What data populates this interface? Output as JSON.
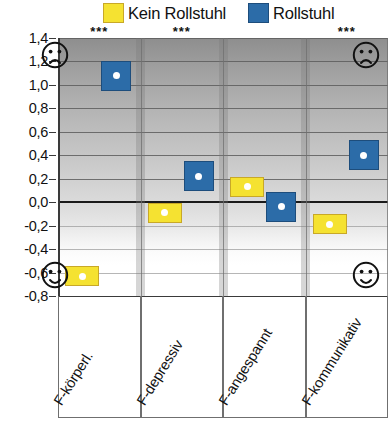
{
  "legend": {
    "entries": [
      {
        "label": "Kein Rollstuhl",
        "color": "#f5e231",
        "key": "kein_rollstuhl"
      },
      {
        "label": "Rollstuhl",
        "color": "#2c6ca8",
        "key": "rollstuhl"
      }
    ]
  },
  "faces": {
    "top_left": "sad-face-icon",
    "top_right": "sad-face-icon",
    "bottom_left": "happy-face-icon",
    "bottom_right": "happy-face-icon"
  },
  "colors": {
    "yellow": "#f5e231",
    "yellow_border": "#c8a828",
    "blue": "#2c6ca8",
    "blue_border": "#1d4d7c",
    "marker_dot": "#ffffff",
    "zero_line": "#1a1a1a",
    "gridline": "#5d5d5d",
    "panel_separator": "#787878"
  },
  "chart_data": {
    "type": "bar",
    "title": "",
    "xlabel": "",
    "ylabel": "",
    "ylim": [
      -0.8,
      1.4
    ],
    "ytick_labels": [
      "1,4",
      "1,2",
      "1,0",
      "0,8",
      "0,6",
      "0,4",
      "0,2",
      "0,0",
      "-0,2",
      "-0,4",
      "-0,6",
      "-0,8"
    ],
    "ytick_values": [
      1.4,
      1.2,
      1.0,
      0.8,
      0.6,
      0.4,
      0.2,
      0.0,
      -0.2,
      -0.4,
      -0.6,
      -0.8
    ],
    "grid": true,
    "legend_position": "top",
    "categories": [
      "F-körperl.",
      "F-depressiv",
      "F-angespannt",
      "F-kommunikativ"
    ],
    "significance": [
      "***",
      "***",
      "",
      "***"
    ],
    "series": [
      {
        "name": "Kein Rollstuhl",
        "color": "#f5e231",
        "values": [
          -0.63,
          -0.09,
          0.13,
          -0.19
        ]
      },
      {
        "name": "Rollstuhl",
        "color": "#2c6ca8",
        "values": [
          1.08,
          0.22,
          -0.04,
          0.4
        ]
      }
    ]
  }
}
